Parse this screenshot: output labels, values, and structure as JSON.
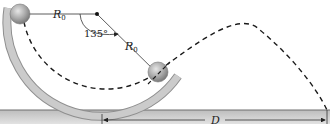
{
  "diagram": {
    "labels": {
      "radius_top": "R",
      "radius_top_sub": "0",
      "radius_diag": "R",
      "radius_diag_sub": "0",
      "angle": "135°",
      "distance": "D"
    },
    "colors": {
      "tube_fill": "#c9c9c9",
      "tube_edge": "#8f8f8f",
      "ground_fill": "#cfcfcf",
      "ground_edge": "#6f6f6f",
      "ball": "#a9a9a9",
      "line": "#222222",
      "dashed_path": "#1a1a1a"
    },
    "elements": [
      "curved tube",
      "ball at entrance",
      "ball at exit",
      "center point",
      "dashed trajectory",
      "ground slab",
      "distance D dimension"
    ]
  }
}
